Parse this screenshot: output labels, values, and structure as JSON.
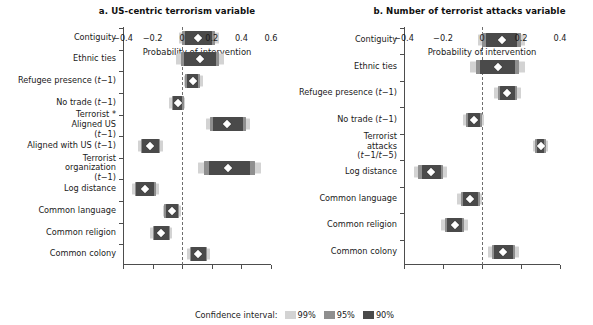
{
  "figure": {
    "width": 593,
    "height": 325,
    "background": "#ffffff"
  },
  "legend": {
    "title": "Confidence interval:",
    "entries": [
      {
        "label": "99%",
        "color": "#d3d3d3"
      },
      {
        "label": "95%",
        "color": "#8f8f8f"
      },
      {
        "label": "90%",
        "color": "#4a4a4a"
      }
    ]
  },
  "chart_data": [
    {
      "type": "bar",
      "panel": "a",
      "title": "a. US-centric terrorism variable",
      "xlabel": "Probability of intervention",
      "ylabel": "",
      "orientation": "horizontal",
      "xlim": [
        -0.4,
        0.6
      ],
      "xticks": [
        -0.4,
        -0.2,
        0,
        0.2,
        0.4,
        0.6
      ],
      "xtick_labels": [
        "−0.4",
        "−0.2",
        "0",
        "0.2",
        "0.4",
        "0.6"
      ],
      "grid": false,
      "reference_line": 0,
      "legend_position": "bottom-center",
      "categories": [
        "Contiguity",
        "Ethnic ties",
        "Refugee presence (t−1)",
        "No trade (t−1)",
        "Terrorist * Aligned US (t−1)",
        "Aligned with US (t−1)",
        "Terrorist organization (t−1)",
        "Log distance",
        "Common language",
        "Common religion",
        "Common colony"
      ],
      "series": [
        {
          "name": "Point estimate",
          "values": [
            0.11,
            0.12,
            0.07,
            -0.03,
            0.3,
            -0.22,
            0.31,
            -0.25,
            -0.07,
            -0.14,
            0.11
          ]
        },
        {
          "name": "90% CI",
          "lower": [
            0.02,
            0.01,
            0.03,
            -0.06,
            0.21,
            -0.27,
            0.18,
            -0.31,
            -0.11,
            -0.19,
            0.06
          ],
          "upper": [
            0.2,
            0.23,
            0.11,
            0.0,
            0.41,
            -0.16,
            0.46,
            -0.19,
            -0.03,
            -0.09,
            0.16
          ]
        },
        {
          "name": "95% CI",
          "lower": [
            0.0,
            -0.01,
            0.02,
            -0.07,
            0.19,
            -0.28,
            0.15,
            -0.32,
            -0.12,
            -0.2,
            0.05
          ],
          "upper": [
            0.22,
            0.25,
            0.12,
            0.01,
            0.43,
            -0.15,
            0.49,
            -0.18,
            -0.02,
            -0.08,
            0.17
          ]
        },
        {
          "name": "99% CI",
          "lower": [
            -0.02,
            -0.04,
            0.01,
            -0.09,
            0.16,
            -0.3,
            0.11,
            -0.34,
            -0.13,
            -0.22,
            0.03
          ],
          "upper": [
            0.25,
            0.28,
            0.14,
            0.02,
            0.46,
            -0.13,
            0.53,
            -0.16,
            -0.01,
            -0.07,
            0.19
          ]
        }
      ]
    },
    {
      "type": "bar",
      "panel": "b",
      "title": "b. Number of terrorist attacks variable",
      "xlabel": "Probability of intervention",
      "ylabel": "",
      "orientation": "horizontal",
      "xlim": [
        -0.4,
        0.4
      ],
      "xticks": [
        -0.4,
        -0.2,
        0,
        0.2,
        0.4
      ],
      "xtick_labels": [
        "−0.4",
        "−0.2",
        "0",
        "0.2",
        "0.4"
      ],
      "grid": false,
      "reference_line": 0,
      "legend_position": "bottom-center",
      "categories": [
        "Contiguity",
        "Ethnic ties",
        "Refugee presence (t−1)",
        "No trade (t−1)",
        "Terrorist attacks (t−1/t−5)",
        "Log distance",
        "Common language",
        "Common religion",
        "Common colony"
      ],
      "series": [
        {
          "name": "Point estimate",
          "values": [
            0.1,
            0.08,
            0.13,
            -0.04,
            0.3,
            -0.26,
            -0.06,
            -0.14,
            0.11
          ]
        },
        {
          "name": "90% CI",
          "lower": [
            0.02,
            -0.01,
            0.09,
            -0.07,
            0.28,
            -0.31,
            -0.1,
            -0.18,
            0.06
          ],
          "upper": [
            0.18,
            0.17,
            0.17,
            -0.01,
            0.32,
            -0.21,
            -0.02,
            -0.1,
            0.16
          ]
        },
        {
          "name": "95% CI",
          "lower": [
            0.0,
            -0.03,
            0.08,
            -0.08,
            0.27,
            -0.33,
            -0.11,
            -0.19,
            0.05
          ],
          "upper": [
            0.2,
            0.19,
            0.18,
            0.0,
            0.33,
            -0.2,
            -0.01,
            -0.09,
            0.17
          ]
        },
        {
          "name": "99% CI",
          "lower": [
            -0.02,
            -0.06,
            0.06,
            -0.1,
            0.26,
            -0.35,
            -0.13,
            -0.21,
            0.03
          ],
          "upper": [
            0.22,
            0.22,
            0.2,
            0.01,
            0.34,
            -0.18,
            0.0,
            -0.07,
            0.19
          ]
        }
      ]
    }
  ]
}
